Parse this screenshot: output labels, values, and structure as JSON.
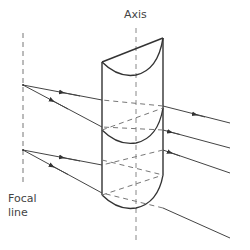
{
  "labels": {
    "axis": "Axis",
    "focal_line_1": "Focal",
    "focal_line_2": "line"
  },
  "colors": {
    "stroke": "#333333",
    "dashed": "#777777",
    "ray": "#444444",
    "background": "#ffffff"
  },
  "diagram": {
    "components": [
      "cylindrical lens",
      "axis",
      "focal line",
      "incident rays",
      "converging rays"
    ],
    "incident_rays": 4,
    "focal_points": 2
  }
}
